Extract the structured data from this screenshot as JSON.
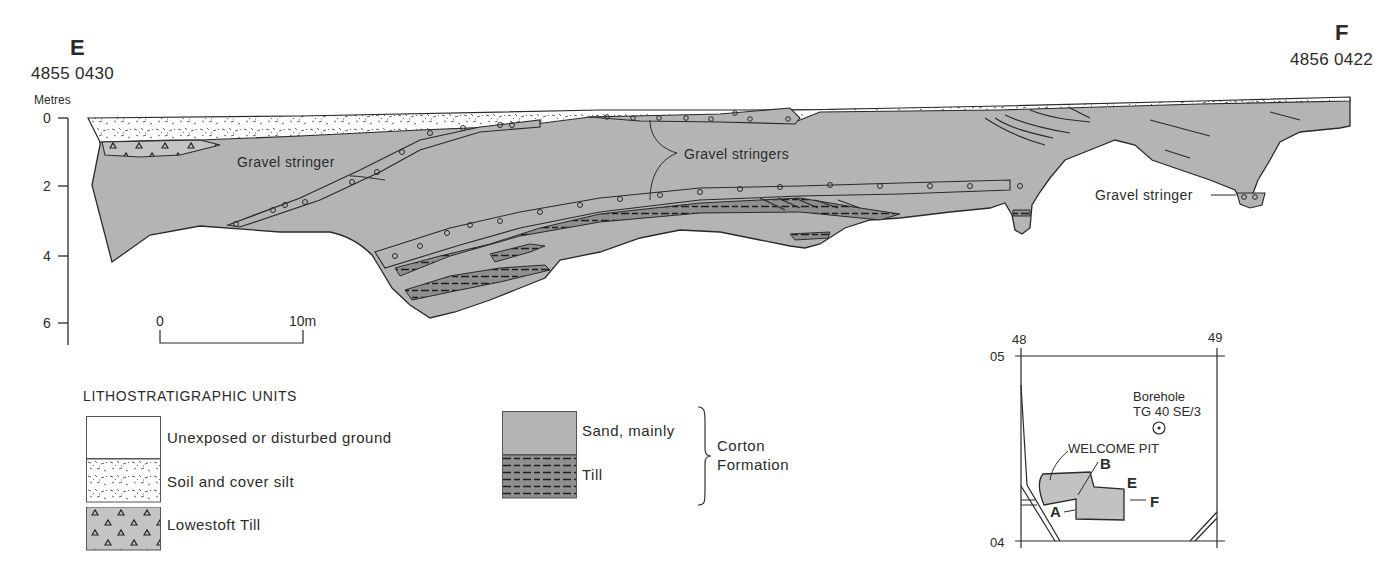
{
  "section": {
    "start": {
      "letter": "E",
      "grid_ref": "4855 0430"
    },
    "end": {
      "letter": "F",
      "grid_ref": "4856 0422"
    }
  },
  "depth_axis": {
    "unit": "Metres",
    "ticks": [
      "0",
      "2",
      "4",
      "6"
    ]
  },
  "scale_bar": {
    "start_label": "0",
    "end_label": "10m"
  },
  "annotations": {
    "gravel_stringer_left": "Gravel stringer",
    "gravel_stringers_center": "Gravel stringers",
    "gravel_stringer_right": "Gravel stringer"
  },
  "legend": {
    "title": "LITHOSTRATIGRAPHIC UNITS",
    "items": [
      {
        "label": "Unexposed or disturbed ground",
        "pattern": "blank"
      },
      {
        "label": "Soil and cover silt",
        "pattern": "stipple"
      },
      {
        "label": "Lowestoft Till",
        "pattern": "triangles"
      }
    ],
    "corton_items": [
      {
        "label": "Sand, mainly",
        "pattern": "grey"
      },
      {
        "label": "Till",
        "pattern": "dashes"
      }
    ],
    "group_label_line1": "Corton",
    "group_label_line2": "Formation"
  },
  "location_map": {
    "grid_x": [
      "48",
      "49"
    ],
    "grid_y": [
      "05",
      "04"
    ],
    "borehole_label": "Borehole",
    "borehole_id": "TG 40 SE/3",
    "pit_label": "WELCOME PIT",
    "point_a": "A",
    "point_b": "B",
    "point_e": "E",
    "point_f": "F"
  },
  "colors": {
    "sand": "#b4b4b4",
    "till": "#8e8e8e",
    "line": "#2a2a2a",
    "paper": "#ffffff"
  }
}
